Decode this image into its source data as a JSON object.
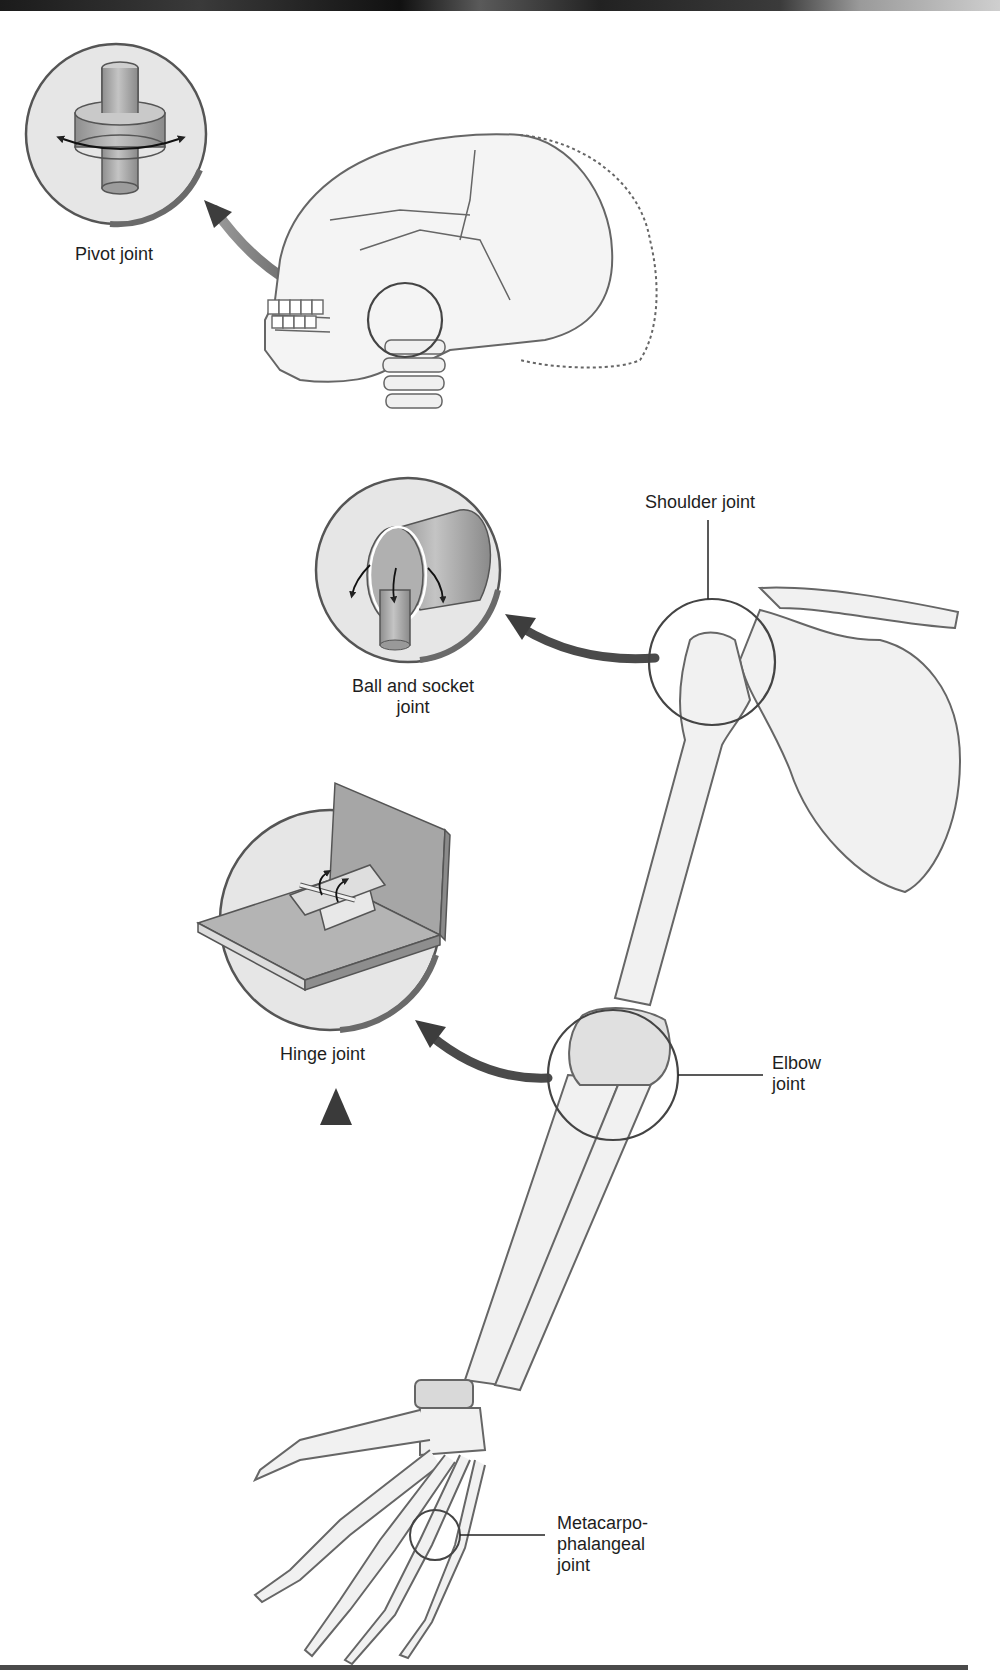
{
  "figure": {
    "topic": "Types of synovial joints",
    "colors": {
      "bone_fill": "#ececec",
      "outline": "#555555",
      "arrow": "#4a4a4a",
      "cylinder": "#a8a8a8",
      "circle_inset": "#e4e4e4"
    },
    "insets": [
      {
        "id": "pivot",
        "label": "Pivot joint",
        "icon": "pivot-cylinder-icon"
      },
      {
        "id": "ball-socket",
        "label": "Ball and socket\njoint",
        "icon": "ball-socket-icon"
      },
      {
        "id": "hinge",
        "label": "Hinge joint",
        "icon": "door-hinge-icon"
      }
    ],
    "callouts": [
      {
        "id": "shoulder",
        "label": "Shoulder joint"
      },
      {
        "id": "elbow",
        "label": "Elbow\njoint"
      },
      {
        "id": "mcp",
        "label": "Metacarpo-\nphalangeal\njoint"
      }
    ]
  }
}
